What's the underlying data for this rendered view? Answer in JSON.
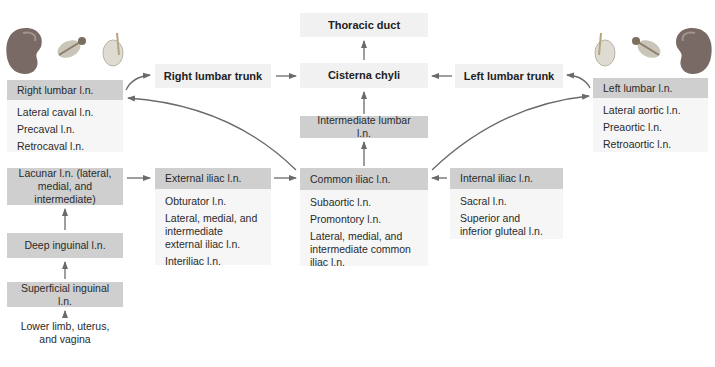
{
  "diagram": {
    "top": {
      "thoracic_duct": "Thoracic duct",
      "cisterna_chyli": "Cisterna chyli",
      "right_lumbar_trunk": "Right lumbar trunk",
      "left_lumbar_trunk": "Left lumbar trunk",
      "intermediate_lumbar": "Intermediate lumbar l.n."
    },
    "right_lumbar": {
      "header": "Right lumbar l.n.",
      "items": [
        "Lateral caval l.n.",
        "Precaval l.n.",
        "Retrocaval l.n."
      ]
    },
    "left_lumbar": {
      "header": "Left lumbar l.n.",
      "items": [
        "Lateral aortic l.n.",
        "Preaortic l.n.",
        "Retroaortic l.n."
      ]
    },
    "lacunar": {
      "header": "Lacunar l.n. (lateral, medial, and intermediate)"
    },
    "deep_inguinal": {
      "header": "Deep inguinal l.n."
    },
    "superficial_inguinal": {
      "header": "Superficial inguinal l.n."
    },
    "source": {
      "text_line1": "Lower limb, uterus,",
      "text_line2": "and vagina"
    },
    "external_iliac": {
      "header": "External iliac l.n.",
      "items": [
        "Obturator l.n.",
        "Lateral, medial, and intermediate external iliac l.n.",
        "Interiliac l.n."
      ]
    },
    "common_iliac": {
      "header": "Common iliac l.n.",
      "items": [
        "Subaortic l.n.",
        "Promontory l.n.",
        "Lateral, medial, and intermediate common iliac l.n."
      ]
    },
    "internal_iliac": {
      "header": "Internal iliac l.n.",
      "items": [
        "Sacral l.n.",
        "Superior and inferior gluteal l.n."
      ]
    },
    "icons": [
      "kidney-icon",
      "adrenal-gland-icon",
      "testis-icon"
    ],
    "colors": {
      "header_fill": "#cfcfcf",
      "light_fill": "#f1f1f1",
      "sub_fill": "#f6f6f6",
      "arrow": "#6a6a6a",
      "kidney": "#7a6a66"
    }
  }
}
